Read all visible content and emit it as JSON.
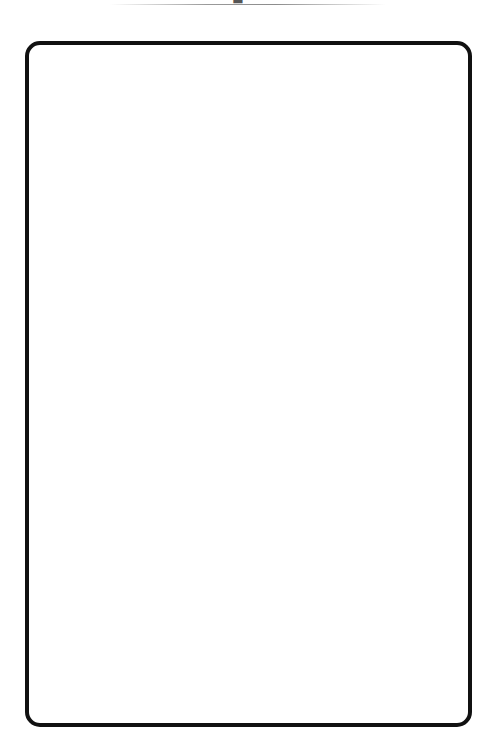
{
  "header": {
    "caption_cropped": "—— ■ ———"
  },
  "frame": {
    "content": "",
    "border_color": "#111111",
    "background_color": "#ffffff"
  }
}
